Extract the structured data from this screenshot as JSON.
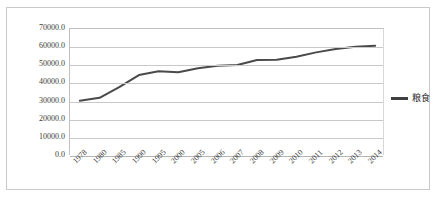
{
  "caption": {
    "text": "图表标题被裁切",
    "visible": false
  },
  "chart_data": {
    "type": "line",
    "title": "",
    "xlabel": "",
    "ylabel": "",
    "grid": true,
    "legend_position": "right",
    "ylim": [
      0,
      70000
    ],
    "ytick_labels": [
      "70000.0",
      "60000.0",
      "50000.0",
      "40000.0",
      "30000.0",
      "20000.0",
      "10000.0",
      "0.0"
    ],
    "ytick_values": [
      70000,
      60000,
      50000,
      40000,
      30000,
      20000,
      10000,
      0
    ],
    "categories": [
      "1978",
      "1980",
      "1985",
      "1990",
      "1995",
      "2000",
      "2005",
      "2006",
      "2007",
      "2008",
      "2009",
      "2010",
      "2011",
      "2012",
      "2013",
      "2014"
    ],
    "series": [
      {
        "name": "粮食",
        "color": "#4a4a4a",
        "values": [
          30477,
          32056,
          37911,
          44624,
          46662,
          46218,
          48402,
          49804,
          50160,
          52871,
          53082,
          54648,
          57121,
          58958,
          60194,
          60710
        ]
      }
    ]
  },
  "legend": {
    "entries": [
      {
        "label": "粮食",
        "color": "#3f3f3f"
      }
    ]
  }
}
